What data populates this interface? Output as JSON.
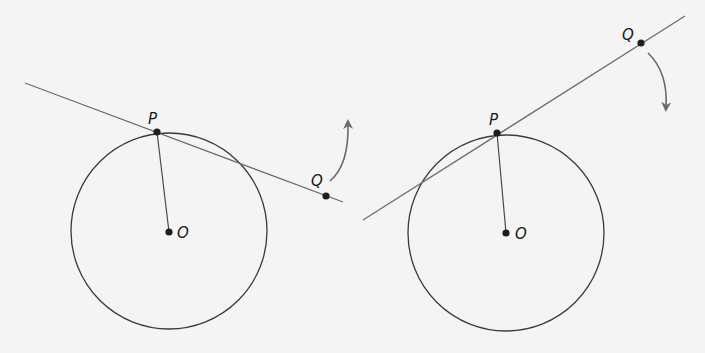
{
  "colors": {
    "background": "#f4f4f4",
    "circle_stroke": "#3a3a3a",
    "line_stroke": "#6e6e6e",
    "radius_stroke": "#4a4a4a",
    "point_fill": "#1e1e1e",
    "arrow_stroke": "#6a6a6a"
  },
  "left_figure": {
    "circle": {
      "cx": 169,
      "cy": 231,
      "r": 98
    },
    "secant_line": {
      "x1": 25,
      "y1": 83,
      "x2": 343,
      "y2": 202
    },
    "points": {
      "P": {
        "x": 157,
        "y": 132,
        "label": "P",
        "label_x": 148,
        "label_y": 124
      },
      "Q": {
        "x": 326,
        "y": 196,
        "label": "Q",
        "label_x": 311,
        "label_y": 186
      },
      "O": {
        "x": 169,
        "y": 232,
        "label": "O",
        "label_x": 177,
        "label_y": 238
      }
    },
    "radius_segment": {
      "x1": 157,
      "y1": 132,
      "x2": 169,
      "y2": 232
    },
    "rotation_arrow": {
      "direction": "counterclockwise-up",
      "path": "M330,181 Q349,165 348,124"
    }
  },
  "right_figure": {
    "circle": {
      "cx": 506,
      "cy": 233,
      "r": 98
    },
    "secant_line": {
      "x1": 363,
      "y1": 220,
      "x2": 685,
      "y2": 16
    },
    "points": {
      "P": {
        "x": 497,
        "y": 133,
        "label": "P",
        "label_x": 489,
        "label_y": 125
      },
      "Q": {
        "x": 641,
        "y": 43,
        "label": "Q",
        "label_x": 622,
        "label_y": 40
      },
      "O": {
        "x": 506,
        "y": 233,
        "label": "O",
        "label_x": 515,
        "label_y": 239
      }
    },
    "radius_segment": {
      "x1": 497,
      "y1": 133,
      "x2": 506,
      "y2": 233
    },
    "rotation_arrow": {
      "direction": "clockwise-down",
      "path": "M648,53 Q668,72 666,107"
    }
  }
}
